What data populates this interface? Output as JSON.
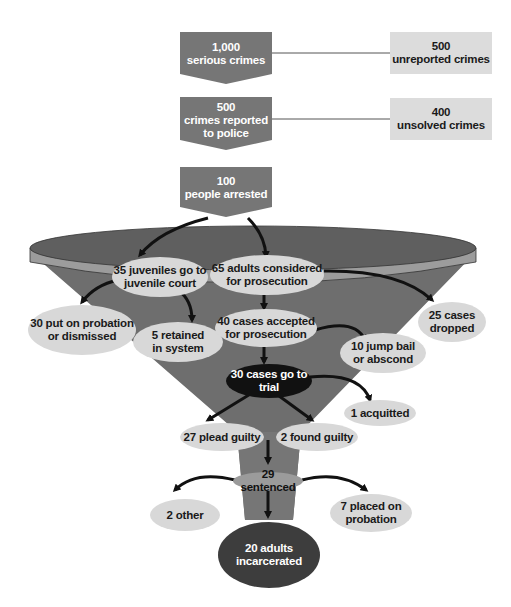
{
  "diagram": {
    "type": "criminal-justice-funnel",
    "colors": {
      "dark_box": "#767676",
      "light_box": "#dcdcdc",
      "funnel_body": "#6e6e6e",
      "funnel_rim": "#9c9c9c",
      "ellipse_light": "#d8d8d8",
      "ellipse_black": "#111111",
      "ellipse_dark": "#3d3d3d",
      "arrow": "#111111"
    },
    "pipeline_boxes": [
      {
        "number": "1,000",
        "label": "serious crimes"
      },
      {
        "number": "500",
        "label": "crimes reported",
        "label2": "to police"
      },
      {
        "number": "100",
        "label": "people arrested"
      }
    ],
    "side_boxes": [
      {
        "number": "500",
        "label": "unreported crimes"
      },
      {
        "number": "400",
        "label": "unsolved crimes"
      }
    ],
    "nodes": {
      "juveniles": {
        "line1": "35 juveniles go to",
        "line2": "juvenile court"
      },
      "adults": {
        "line1": "65 adults considered",
        "line2": "for prosecution"
      },
      "probation_dismissed": {
        "line1": "30 put on probation",
        "line2": "or dismissed"
      },
      "retained": {
        "line1": "5 retained",
        "line2": "in system"
      },
      "accepted": {
        "line1": "40 cases accepted",
        "line2": "for prosecution"
      },
      "dropped": {
        "line1": "25 cases",
        "line2": "dropped"
      },
      "jump_bail": {
        "line1": "10 jump bail",
        "line2": "or abscond"
      },
      "trial": {
        "line1": "30 cases go to",
        "line2": "trial"
      },
      "acquitted": {
        "line1": "1 acquitted"
      },
      "plead_guilty": {
        "line1": "27 plead guilty"
      },
      "found_guilty": {
        "line1": "2 found guilty"
      },
      "sentenced": {
        "line1": "29 sentenced"
      },
      "other": {
        "line1": "2 other"
      },
      "placed_probation": {
        "line1": "7 placed on",
        "line2": "probation"
      },
      "incarcerated": {
        "line1": "20 adults",
        "line2": "incarcerated"
      }
    }
  }
}
